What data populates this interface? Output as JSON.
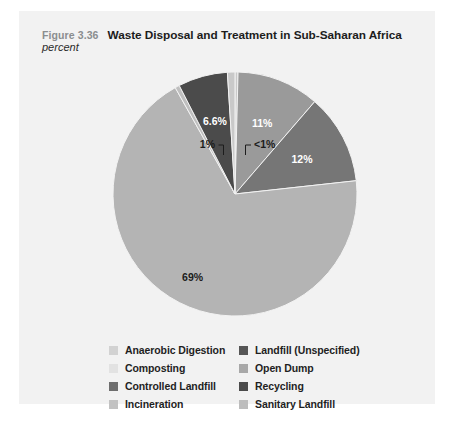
{
  "figure": {
    "number": "Figure 3.36",
    "title": "Waste Disposal and Treatment in Sub-Saharan Africa",
    "subtitle": "percent",
    "panel_background": "#f2f2f2"
  },
  "chart_data": {
    "type": "pie",
    "title": "Waste Disposal and Treatment in Sub-Saharan Africa",
    "subtitle": "percent",
    "unit": "percent",
    "legend_position": "bottom",
    "labels": [
      "Anaerobic Digestion",
      "Composting",
      "Controlled Landfill",
      "Incineration",
      "Landfill (Unspecified)",
      "Open Dump",
      "Recycling",
      "Sanitary Landfill"
    ],
    "slices": [
      {
        "name": "Sanitary Landfill",
        "display": "<1%",
        "value": 0.4,
        "color": "#c9c9c9",
        "label_type": "callout",
        "label_side": "right"
      },
      {
        "name": "Landfill (Unspecified)",
        "display": "11%",
        "value": 11.0,
        "color": "#9a9a9a",
        "label_type": "inside",
        "label_color": "light"
      },
      {
        "name": "Open Dump",
        "display": "12%",
        "value": 12.0,
        "color": "#767676",
        "label_type": "inside",
        "label_color": "light"
      },
      {
        "name": "Controlled Landfill",
        "display": "69%",
        "value": 69.0,
        "color": "#b4b4b4",
        "label_type": "inside",
        "label_color": "dark"
      },
      {
        "name": "Incineration",
        "display": "",
        "value": 0.6,
        "color": "#bfbfbf",
        "label_type": "none"
      },
      {
        "name": "Recycling",
        "display": "6.6%",
        "value": 6.6,
        "color": "#4b4b4b",
        "label_type": "inside",
        "label_color": "light"
      },
      {
        "name": "Anaerobic Digestion",
        "display": "1%",
        "value": 1.0,
        "color": "#c9c9c9",
        "label_type": "callout",
        "label_side": "left"
      }
    ],
    "values": [
      0.4,
      11.0,
      12.0,
      69.0,
      0.6,
      6.6,
      1.0
    ],
    "categories": [
      "Sanitary Landfill",
      "Landfill (Unspecified)",
      "Open Dump",
      "Controlled Landfill",
      "Incineration",
      "Recycling",
      "Anaerobic Digestion"
    ],
    "data_labels": [
      "<1%",
      "11%",
      "12%",
      "69%",
      "",
      "6.6%",
      "1%"
    ]
  },
  "labels": {
    "pct_lt1": "<1%",
    "pct_11": "11%",
    "pct_12": "12%",
    "pct_69": "69%",
    "pct_66": "6.6%",
    "pct_1": "1%"
  },
  "legend": {
    "column_left": [
      {
        "label": "Anaerobic Digestion",
        "color": "#d2d2d2"
      },
      {
        "label": "Composting",
        "color": "#e2e2e2"
      },
      {
        "label": "Controlled Landfill",
        "color": "#6e6e6e"
      },
      {
        "label": "Incineration",
        "color": "#c2c2c2"
      }
    ],
    "column_right": [
      {
        "label": "Landfill (Unspecified)",
        "color": "#565656"
      },
      {
        "label": "Open Dump",
        "color": "#a8a8a8"
      },
      {
        "label": "Recycling",
        "color": "#4b4b4b"
      },
      {
        "label": "Sanitary Landfill",
        "color": "#bdbdbd"
      }
    ]
  }
}
